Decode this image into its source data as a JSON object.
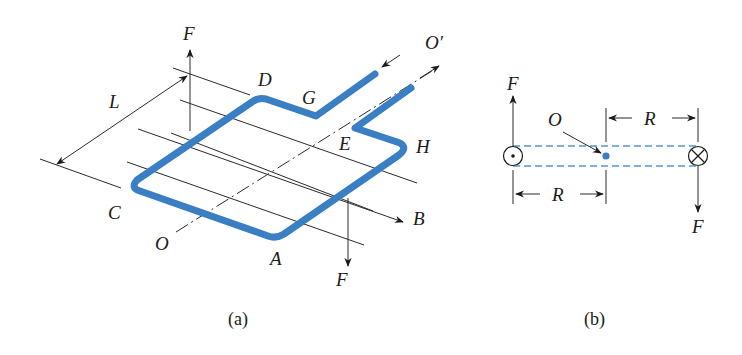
{
  "figure": {
    "colors": {
      "loop": "#3a7fc4",
      "dashed_guides": "#5b93cf",
      "center_dot": "#3a7fc4",
      "ink": "#1a1a1a"
    },
    "panel_a": {
      "caption": "(a)",
      "labels": {
        "force_top": "F",
        "force_bottom": "F",
        "corner_D": "D",
        "corner_G": "G",
        "corner_E": "E",
        "corner_H": "H",
        "corner_C": "C",
        "corner_A": "A",
        "axis_O": "O",
        "axis_O_prime": "O′",
        "length_L": "L",
        "field_B": "B"
      }
    },
    "panel_b": {
      "caption": "(b)",
      "labels": {
        "force_top": "F",
        "force_bottom": "F",
        "center_O": "O",
        "radius_top": "R",
        "radius_bottom": "R"
      },
      "symbols": {
        "left_conductor": "current-out-of-page",
        "right_conductor": "current-into-page"
      }
    }
  }
}
